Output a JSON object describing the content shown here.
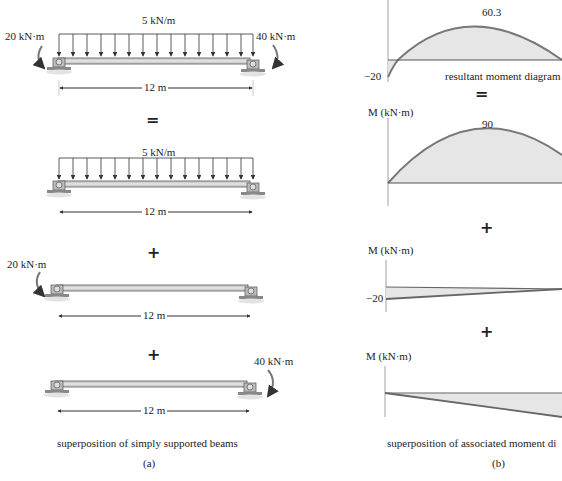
{
  "panel_a": {
    "caption": "superposition of simply supported beams",
    "label": "(a)",
    "beams": [
      {
        "left_moment": "20 kN·m",
        "load": "5 kN/m",
        "right_moment": "40 kN·m",
        "span": "12 m"
      },
      {
        "load": "5 kN/m",
        "span": "12 m"
      },
      {
        "left_moment": "20 kN·m",
        "span": "12 m"
      },
      {
        "right_moment": "40 kN·m",
        "span": "12 m"
      }
    ],
    "operators": [
      "=",
      "+",
      "+"
    ]
  },
  "panel_b": {
    "caption": "superposition of associated moment di",
    "label": "(b)",
    "axis_label": "M (kN·m)",
    "diagrams": [
      {
        "peak": "60.3",
        "min": "−20",
        "title": "resultant moment diagram"
      },
      {
        "peak": "90"
      },
      {
        "min": "−20"
      },
      {}
    ],
    "operators": [
      "=",
      "+",
      "+"
    ]
  },
  "colors": {
    "fill": "#e6e6e6",
    "line": "#6b6b6b",
    "beam": "#c8c8c8"
  }
}
